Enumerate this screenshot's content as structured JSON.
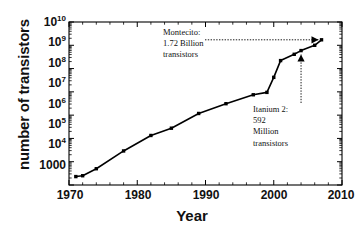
{
  "chart_data": {
    "type": "line",
    "title": "",
    "xlabel": "Year",
    "ylabel": "number of transistors",
    "xlim": [
      1970,
      2010
    ],
    "ylim": [
      1000,
      10000000000
    ],
    "yscale": "log",
    "xscale": "linear",
    "grid": false,
    "legend": null,
    "xticks": [
      "1970",
      "1980",
      "1990",
      "2000",
      "2010"
    ],
    "xtick_values": [
      1970,
      1980,
      1990,
      2000,
      2010
    ],
    "yticks": [
      "1000",
      "10^4",
      "10^5",
      "10^6",
      "10^7",
      "10^8",
      "10^9",
      "10^10"
    ],
    "ytick_values": [
      1000,
      10000,
      100000,
      1000000,
      10000000,
      100000000,
      1000000000,
      10000000000
    ],
    "marker": "square",
    "line_color": "#000000",
    "series": [
      {
        "name": "transistor count",
        "x": [
          1971,
          1972,
          1974,
          1978,
          1982,
          1985,
          1989,
          1993,
          1997,
          1999,
          2000,
          2001,
          2003,
          2004,
          2006,
          2007
        ],
        "values": [
          2300,
          2500,
          5000,
          29000,
          134000,
          275000,
          1180000,
          3100000,
          7500000,
          9500000,
          42000000,
          220000000,
          410000000,
          592000000,
          1000000000,
          1720000000
        ]
      }
    ],
    "annotations": [
      {
        "id": "montecito",
        "text": "Montecito:\n1.72 Billion\ntransistors",
        "arrow": "dotted-right",
        "points_to_x": 2007,
        "points_to_value": 1720000000
      },
      {
        "id": "itanium2",
        "text": "Itanium 2:\n592\nMillion\ntransistors",
        "arrow": "dotted-up",
        "points_to_x": 2004,
        "points_to_value": 592000000
      }
    ]
  },
  "axis": {
    "x_label": "Year",
    "y_label": "number of transistors"
  }
}
